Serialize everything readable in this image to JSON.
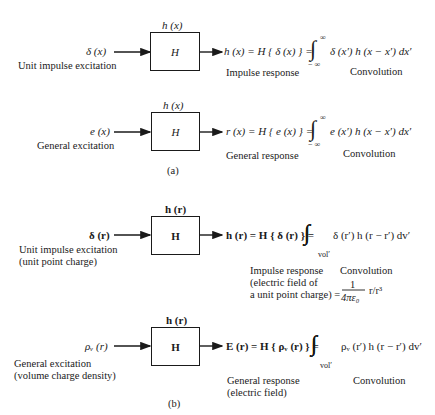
{
  "panel_a": {
    "caption": "(a)",
    "row1": {
      "system_label": "h (x)",
      "box_label": "H",
      "input": "δ (x)",
      "input_desc": "Unit impulse excitation",
      "output_eq_lhs": "h (x) = H { δ (x) } =",
      "integral_upper": "∞",
      "integral_lower": "− ∞",
      "integrand": "δ (x′) h (x − x′) dx′",
      "output_desc": "Impulse response",
      "conv_desc": "Convolution"
    },
    "row2": {
      "system_label": "h (x)",
      "box_label": "H",
      "input": "e (x)",
      "input_desc": "General excitation",
      "output_eq_lhs": "r (x) = H { e (x) } =",
      "integral_upper": "∞",
      "integral_lower": "− ∞",
      "integrand": "e (x′) h (x − x′) dx′",
      "output_desc": "General response",
      "conv_desc": "Convolution"
    }
  },
  "panel_b": {
    "caption": "(b)",
    "row1": {
      "system_label": "h (r)",
      "box_label": "H",
      "input": "δ (r)",
      "input_desc_line1": "Unit impulse excitation",
      "input_desc_line2": "(unit point charge)",
      "output_eq_lhs": "h (r) = H { δ (r) } =",
      "integral_sub": "vol′",
      "integrand": "δ (r′) h (r − r′) dv′",
      "output_desc_line1": "Impulse response",
      "output_desc_line2": "(electric field of",
      "output_desc_line3": "a unit point charge) =",
      "frac_num": "1",
      "frac_den": "4πε₀",
      "frac_tail": "r/r³",
      "conv_desc": "Convolution"
    },
    "row2": {
      "system_label": "h (r)",
      "box_label": "H",
      "input": "ρᵥ (r)",
      "input_desc_line1": "General excitation",
      "input_desc_line2": "(volume charge density)",
      "output_eq_lhs": "E (r) = H { ρᵥ (r) } =",
      "integral_sub": "vol′",
      "integrand": "ρᵥ (r′) h (r − r′) dv′",
      "output_desc_line1": "General response",
      "output_desc_line2": "(electric field)",
      "conv_desc": "Convolution"
    }
  }
}
